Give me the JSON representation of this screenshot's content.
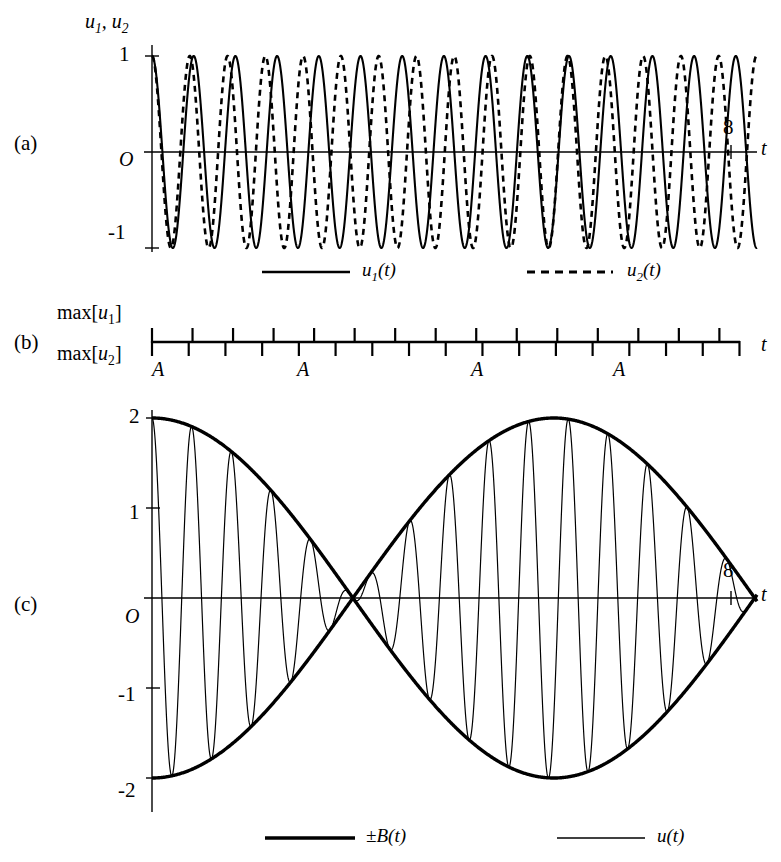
{
  "figure": {
    "background": "#ffffff",
    "ink": "#000000"
  },
  "panels": {
    "a": {
      "letter": "(a)",
      "y_axis_title": "u1, u2",
      "y_ticks": [
        "1",
        "-1"
      ],
      "origin_label": "O",
      "x_tick_label": "8",
      "x_axis_label": "t",
      "legend": [
        {
          "style": "solid",
          "label": "u1(t)"
        },
        {
          "style": "dashed",
          "label": "u2(t)"
        }
      ]
    },
    "b": {
      "letter": "(b)",
      "row_label_top": "max[u1]",
      "row_label_bottom": "max[u2]",
      "x_axis_label": "t",
      "coincidence_labels": [
        "A",
        "A",
        "A",
        "A"
      ]
    },
    "c": {
      "letter": "(c)",
      "y_ticks": [
        "2",
        "1",
        "-1",
        "-2"
      ],
      "origin_label": "O",
      "x_tick_label": "8",
      "x_axis_label": "t",
      "legend": [
        {
          "style": "thick",
          "label": "±B(t)"
        },
        {
          "style": "thin",
          "label": "u(t)"
        }
      ]
    }
  },
  "chart_data": {
    "type": "line",
    "title": "",
    "subplots": [
      {
        "id": "a",
        "type": "line",
        "xlabel": "t",
        "ylabel": "u1, u2",
        "xlim": [
          0,
          8.6
        ],
        "ylim": [
          -1.15,
          1.15
        ],
        "yticks": [
          1,
          -1
        ],
        "xticks": [
          8
        ],
        "grid": false,
        "series": [
          {
            "name": "u1(t)",
            "style": "solid",
            "amplitude": 1.0,
            "cycles_over_range": 14.5,
            "angular_frequency": 10.6,
            "phase": 0
          },
          {
            "name": "u2(t)",
            "style": "dashed",
            "amplitude": 1.0,
            "cycles_over_range": 16.0,
            "angular_frequency": 11.7,
            "phase": 0
          }
        ],
        "legend_position": "below"
      },
      {
        "id": "b",
        "type": "timeline",
        "xlabel": "t",
        "ylabel": "max[u1] / max[u2]",
        "xlim": [
          0,
          8.6
        ],
        "description": "Up-ticks mark maxima of u1, down-ticks mark maxima of u2; they coincide at the points labelled A",
        "up_tick_count": 15,
        "down_tick_count": 16,
        "coincidence_points_t": [
          0.0,
          2.1,
          4.2,
          6.3
        ],
        "coincidence_label": "A"
      },
      {
        "id": "c",
        "type": "line",
        "xlabel": "t",
        "ylabel": "u",
        "xlim": [
          0,
          8.6
        ],
        "ylim": [
          -2.3,
          2.3
        ],
        "yticks": [
          2,
          1,
          -1,
          -2
        ],
        "xticks": [
          8
        ],
        "grid": false,
        "series": [
          {
            "name": "±B(t)",
            "style": "thick",
            "amplitude": 2.0,
            "beat_cycles_over_range": 4.0,
            "angular_frequency": 0.55
          },
          {
            "name": "u(t)",
            "style": "thin",
            "amplitude": 2.0,
            "carrier_cycles_over_range": 15.25,
            "angular_frequency": 11.15
          }
        ],
        "legend_position": "below"
      }
    ]
  }
}
